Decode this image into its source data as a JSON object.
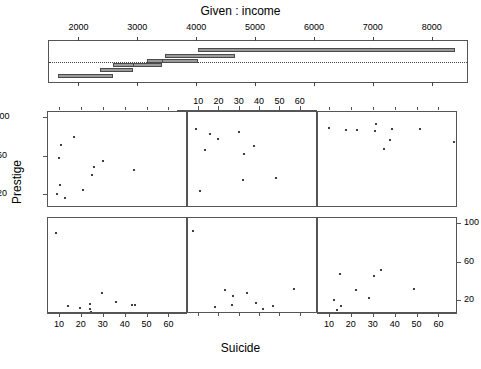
{
  "titles": {
    "given": "Given :  income",
    "xlabel": "Suicide",
    "ylabel": "Prestige"
  },
  "chart_data": {
    "type": "scatter",
    "title": "Given :  income",
    "xlabel": "Suicide",
    "ylabel": "Prestige",
    "plot_kind": "coplot",
    "conditioning_variable": "income",
    "conditioning_axis": {
      "ticks": [
        2000,
        3000,
        4000,
        5000,
        6000,
        7000,
        8000
      ],
      "range": [
        1500,
        8600
      ]
    },
    "conditioning_intervals": [
      {
        "index": 1,
        "min": 1656,
        "max": 2594,
        "row": 6
      },
      {
        "index": 2,
        "min": 2368,
        "max": 2929,
        "row": 5
      },
      {
        "index": 3,
        "min": 2594,
        "max": 3161,
        "row": 4
      },
      {
        "index": 4,
        "min": 2929,
        "max": 3419,
        "row": 4
      },
      {
        "index": 5,
        "min": 3161,
        "max": 3478,
        "row": 3
      },
      {
        "index": 6,
        "min": 3419,
        "max": 4023,
        "row": 3
      },
      {
        "index": 7,
        "min": 3478,
        "max": 4667,
        "row": 2
      },
      {
        "index": 8,
        "min": 4023,
        "max": 8403,
        "row": 1
      }
    ],
    "x_axis": {
      "label": "Suicide",
      "ticks": [
        10,
        20,
        30,
        40,
        50,
        60
      ],
      "range": [
        5,
        68
      ]
    },
    "y_axis": {
      "label": "Prestige",
      "ticks": [
        20,
        60,
        100
      ],
      "range": [
        8,
        105
      ]
    },
    "panels": [
      {
        "row": 1,
        "col": 1,
        "position": "top-left",
        "x_axis_side": "none",
        "y_axis_side": "left",
        "points": [
          {
            "x": 10.5,
            "y": 72
          },
          {
            "x": 9.4,
            "y": 59
          },
          {
            "x": 16.5,
            "y": 80
          },
          {
            "x": 9.8,
            "y": 31
          },
          {
            "x": 8.8,
            "y": 21
          },
          {
            "x": 12.2,
            "y": 17
          },
          {
            "x": 20.4,
            "y": 26
          },
          {
            "x": 24.8,
            "y": 41
          },
          {
            "x": 25.6,
            "y": 49
          },
          {
            "x": 29.6,
            "y": 55
          },
          {
            "x": 43.8,
            "y": 46
          }
        ]
      },
      {
        "row": 1,
        "col": 2,
        "position": "top-middle",
        "x_axis_side": "top",
        "y_axis_side": "none",
        "points": [
          {
            "x": 8.6,
            "y": 88
          },
          {
            "x": 15.5,
            "y": 83
          },
          {
            "x": 19.4,
            "y": 78
          },
          {
            "x": 13.0,
            "y": 67
          },
          {
            "x": 29.6,
            "y": 85
          },
          {
            "x": 37.0,
            "y": 71
          },
          {
            "x": 32.0,
            "y": 63
          },
          {
            "x": 31.8,
            "y": 36
          },
          {
            "x": 10.5,
            "y": 24
          },
          {
            "x": 48.0,
            "y": 38
          }
        ]
      },
      {
        "row": 1,
        "col": 3,
        "position": "top-right",
        "x_axis_side": "none",
        "y_axis_side": "none",
        "points": [
          {
            "x": 9.6,
            "y": 90
          },
          {
            "x": 17.5,
            "y": 87
          },
          {
            "x": 22.3,
            "y": 87
          },
          {
            "x": 31.0,
            "y": 94
          },
          {
            "x": 30.6,
            "y": 86
          },
          {
            "x": 38.5,
            "y": 88
          },
          {
            "x": 51.0,
            "y": 88
          },
          {
            "x": 37.2,
            "y": 77
          },
          {
            "x": 34.5,
            "y": 68
          },
          {
            "x": 66.5,
            "y": 75
          }
        ]
      },
      {
        "row": 2,
        "col": 1,
        "position": "bottom-left",
        "x_axis_side": "bottom",
        "y_axis_side": "none",
        "points": [
          {
            "x": 8.0,
            "y": 91
          },
          {
            "x": 29.0,
            "y": 29
          },
          {
            "x": 13.5,
            "y": 15
          },
          {
            "x": 19.0,
            "y": 13
          },
          {
            "x": 23.8,
            "y": 17
          },
          {
            "x": 23.8,
            "y": 12
          },
          {
            "x": 24.2,
            "y": 9
          },
          {
            "x": 35.5,
            "y": 19
          },
          {
            "x": 43.0,
            "y": 16
          },
          {
            "x": 44.4,
            "y": 16
          }
        ]
      },
      {
        "row": 2,
        "col": 2,
        "position": "bottom-middle",
        "x_axis_side": "none",
        "y_axis_side": "none",
        "points": [
          {
            "x": 7.2,
            "y": 93
          },
          {
            "x": 22.8,
            "y": 32
          },
          {
            "x": 26.6,
            "y": 26
          },
          {
            "x": 33.5,
            "y": 29
          },
          {
            "x": 26.4,
            "y": 16
          },
          {
            "x": 17.8,
            "y": 14
          },
          {
            "x": 38.0,
            "y": 18
          },
          {
            "x": 41.5,
            "y": 12
          },
          {
            "x": 46.2,
            "y": 15
          },
          {
            "x": 56.8,
            "y": 33
          }
        ]
      },
      {
        "row": 2,
        "col": 3,
        "position": "bottom-right",
        "x_axis_side": "bottom",
        "y_axis_side": "right",
        "points": [
          {
            "x": 14.5,
            "y": 48
          },
          {
            "x": 30.0,
            "y": 46
          },
          {
            "x": 33.5,
            "y": 52
          },
          {
            "x": 48.5,
            "y": 33
          },
          {
            "x": 22.0,
            "y": 32
          },
          {
            "x": 28.0,
            "y": 23
          },
          {
            "x": 11.8,
            "y": 21
          },
          {
            "x": 15.0,
            "y": 15
          },
          {
            "x": 13.2,
            "y": 11
          },
          {
            "x": 37.0,
            "y": 8
          }
        ]
      }
    ]
  }
}
